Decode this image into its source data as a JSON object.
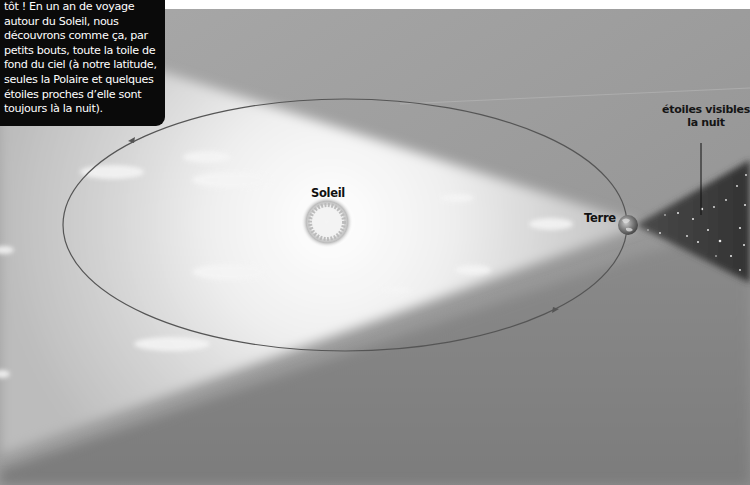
{
  "caption": {
    "lines": [
      "tôt ! En un an de voyage",
      "autour du Soleil, nous",
      "découvrons comme ça, par",
      "petits bouts, toute la toile de",
      "fond du ciel (à notre latitude,",
      "seules la Polaire et quelques",
      "étoiles proches d’elle sont",
      "toujours là la nuit)."
    ]
  },
  "labels": {
    "sun": "Soleil",
    "earth": "Terre",
    "stars_line1": "étoiles visibles",
    "stars_line2": "la nuit"
  },
  "diagram": {
    "orbit": {
      "cx": 345,
      "cy": 225,
      "rx": 282,
      "ry": 126
    },
    "sun": {
      "x": 327,
      "y": 222,
      "r": 17
    },
    "earth": {
      "x": 628,
      "y": 225,
      "r": 10
    },
    "colors": {
      "sky": "#9a9a9a",
      "sky_dark": "#7d7d7d",
      "daylight": "#f2f2f2",
      "night_cone": "#3a3a3a",
      "caption_bg": "#0a0a0a",
      "orbit_line": "#555555"
    }
  }
}
